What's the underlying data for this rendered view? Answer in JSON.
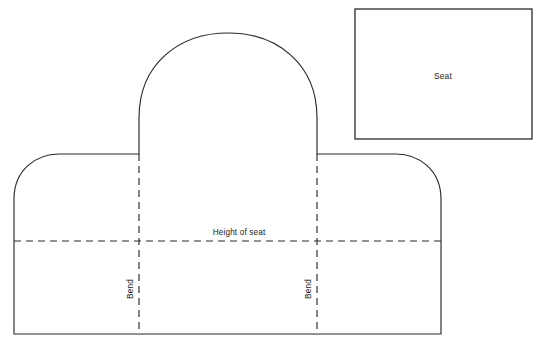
{
  "diagram": {
    "background_color": "#ffffff",
    "stroke_color": "#2b2b2b",
    "text_color": "#1a1a1a",
    "labels": {
      "seat": "Seat",
      "height_of_seat": "Height of seat",
      "bend_left": "Bend",
      "bend_right": "Bend"
    },
    "shapes": {
      "seat_panel": {
        "name": "seat-rectangle",
        "x": 355,
        "y": 9,
        "width": 177,
        "height": 130
      },
      "cover_outline": {
        "name": "cover-outline",
        "left": 14,
        "right": 441,
        "bottom": 334,
        "shoulder_y": 154,
        "arch_left_x": 139,
        "arch_right_x": 317,
        "arch_top_y": 33,
        "arch_spring_y": 118,
        "shoulder_corner_radius": 45
      }
    },
    "fold_lines": [
      {
        "name": "bend-line-left",
        "orientation": "vertical",
        "x": 139,
        "y1": 154,
        "y2": 334
      },
      {
        "name": "bend-line-right",
        "orientation": "vertical",
        "x": 317,
        "y1": 154,
        "y2": 334
      },
      {
        "name": "height-of-seat-line",
        "orientation": "horizontal",
        "y": 241,
        "x1": 14,
        "x2": 441
      }
    ],
    "label_positions": {
      "seat": {
        "x": 443,
        "y": 77
      },
      "height_of_seat": {
        "x": 239,
        "y": 235
      },
      "bend_left": {
        "x": 133,
        "y": 289,
        "rotation": -90
      },
      "bend_right": {
        "x": 311,
        "y": 289,
        "rotation": -90
      }
    }
  }
}
